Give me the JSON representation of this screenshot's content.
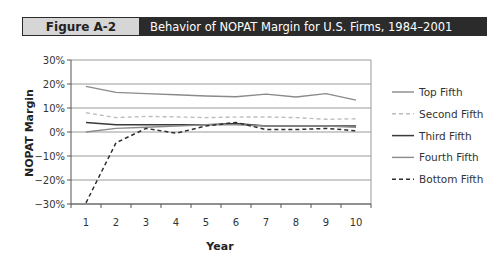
{
  "figure": {
    "label": "Figure A-2",
    "title": "Behavior of NOPAT Margin for U.S. Firms, 1984–2001"
  },
  "chart_data": {
    "type": "line",
    "title": "Behavior of NOPAT Margin for U.S. Firms, 1984–2001",
    "xlabel": "Year",
    "ylabel": "NOPAT Margin",
    "x": [
      1,
      2,
      3,
      4,
      5,
      6,
      7,
      8,
      9,
      10
    ],
    "x_tick_labels": [
      "1",
      "2",
      "3",
      "4",
      "5",
      "6",
      "7",
      "8",
      "9",
      "10"
    ],
    "y_tick_labels": [
      "30%",
      "20%",
      "10%",
      "0%",
      "−10%",
      "−20%",
      "−30%"
    ],
    "y_ticks": [
      30,
      20,
      10,
      0,
      -10,
      -20,
      -30
    ],
    "ylim": [
      -30,
      30
    ],
    "grid": true,
    "legend_position": "right",
    "series": [
      {
        "name": "Top Fifth",
        "color": "#8a8a8a",
        "dash": "none",
        "width": 1.4,
        "values": [
          19,
          16.5,
          16,
          15.5,
          15,
          14.7,
          15.8,
          14.6,
          16,
          13.3
        ]
      },
      {
        "name": "Second Fifth",
        "color": "#bdbdbd",
        "dash": "4,3",
        "width": 1.4,
        "values": [
          8,
          6,
          6.5,
          6.3,
          6,
          6.2,
          6.3,
          6,
          5.3,
          5.5
        ]
      },
      {
        "name": "Third Fifth",
        "color": "#3a3a3a",
        "dash": "none",
        "width": 1.5,
        "values": [
          4,
          3,
          3,
          3,
          3,
          3.5,
          2.5,
          2.5,
          2.5,
          2.5
        ]
      },
      {
        "name": "Fourth Fifth",
        "color": "#8a8a8a",
        "dash": "none",
        "width": 1.4,
        "values": [
          0,
          1.5,
          2,
          2.5,
          3,
          3,
          2.5,
          2.5,
          2.5,
          2
        ]
      },
      {
        "name": "Bottom Fifth",
        "color": "#2e2e2e",
        "dash": "4,3",
        "width": 1.5,
        "values": [
          -29.5,
          -4.5,
          1.5,
          -0.5,
          2.5,
          4,
          1,
          1,
          1.5,
          0.5
        ]
      }
    ]
  }
}
